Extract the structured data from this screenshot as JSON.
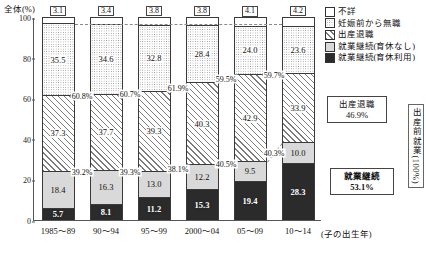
{
  "chart_data": {
    "type": "bar",
    "title": "",
    "ylabel": "全体(%)",
    "xlabel": "(子の出生年)",
    "ylim": [
      0,
      100
    ],
    "yticks": [
      "0",
      "20",
      "40",
      "60",
      "80",
      "100"
    ],
    "categories": [
      "1985～89",
      "90～94",
      "95～99",
      "2000～04",
      "05～09",
      "10～14"
    ],
    "legend": [
      {
        "key": "fusho",
        "label": "不詳",
        "pattern": "p-fusho"
      },
      {
        "key": "muwork",
        "label": "妊娠前から無職",
        "pattern": "p-muwork"
      },
      {
        "key": "taishoku",
        "label": "出産退職",
        "pattern": "p-taishoku"
      },
      {
        "key": "keizoku_n",
        "label": "就業継続(育休なし)",
        "pattern": "p-keizoku-n"
      },
      {
        "key": "keizoku_i",
        "label": "就業継続(育休利用)",
        "pattern": "p-keizoku-i"
      }
    ],
    "series": [
      {
        "name": "就業継続(育休利用)",
        "values": [
          5.7,
          8.1,
          11.2,
          15.3,
          19.4,
          28.3
        ]
      },
      {
        "name": "就業継続(育休なし)",
        "values": [
          18.4,
          16.3,
          13.0,
          12.2,
          9.5,
          10.0
        ]
      },
      {
        "name": "出産退職",
        "values": [
          37.3,
          37.7,
          39.3,
          40.3,
          42.9,
          33.9
        ]
      },
      {
        "name": "妊娠前から無職",
        "values": [
          35.5,
          34.6,
          32.8,
          28.4,
          24.0,
          23.6
        ]
      },
      {
        "name": "不詳",
        "values": [
          3.1,
          3.4,
          3.8,
          3.8,
          4.1,
          4.2
        ]
      }
    ],
    "annotation_pct_upper": [
      "60.8%",
      "60.7%",
      "61.9%",
      "59.5%",
      "59.7%"
    ],
    "annotation_pct_lower": [
      "39.2%",
      "39.3%",
      "38.1%",
      "40.5%",
      "40.3%"
    ],
    "callouts": [
      {
        "name": "taishoku",
        "title": "出産退職",
        "value": "46.9%"
      },
      {
        "name": "keizoku",
        "title": "就業継続",
        "value": "53.1%"
      }
    ],
    "side_label": "出産前就業(100%)"
  }
}
